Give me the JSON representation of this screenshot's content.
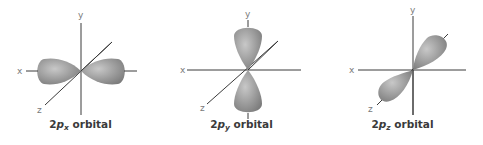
{
  "orbitals": [
    {
      "name": "2px",
      "prefix": "2",
      "p": "p",
      "subscript": "x",
      "suffix": " orbital",
      "axes": {
        "x": "x",
        "y": "y",
        "z": "z"
      }
    },
    {
      "name": "2py",
      "prefix": "2",
      "p": "p",
      "subscript": "y",
      "suffix": " orbital",
      "axes": {
        "x": "x",
        "y": "y",
        "z": "z"
      }
    },
    {
      "name": "2pz",
      "prefix": "2",
      "p": "p",
      "subscript": "z",
      "suffix": " orbital",
      "axes": {
        "x": "x",
        "y": "y",
        "z": "z"
      }
    }
  ],
  "colors": {
    "lobe": "#8f8f8f",
    "lobe_highlight": "#c4c4c4",
    "axis": "#3a3a3a",
    "label": "#7a7a7a"
  }
}
